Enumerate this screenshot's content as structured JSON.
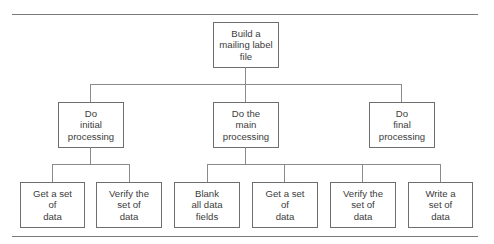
{
  "diagram": {
    "type": "hierarchy-chart",
    "root": {
      "label": "Build a\nmailing label\nfile"
    },
    "level2": [
      {
        "label": "Do\ninitial\nprocessing"
      },
      {
        "label": "Do the\nmain\nprocessing"
      },
      {
        "label": "Do\nfinal\nprocessing"
      }
    ],
    "level3": [
      {
        "parent": "Do initial processing",
        "label": "Get a set\nof\ndata"
      },
      {
        "parent": "Do initial processing",
        "label": "Verify the\nset of\ndata"
      },
      {
        "parent": "Do the main processing",
        "label": "Blank\nall data\nfields"
      },
      {
        "parent": "Do the main processing",
        "label": "Get a set\nof\ndata"
      },
      {
        "parent": "Do the main processing",
        "label": "Verify the\nset of\ndata"
      },
      {
        "parent": "Do the main processing",
        "label": "Write a\nset of\ndata"
      }
    ]
  }
}
